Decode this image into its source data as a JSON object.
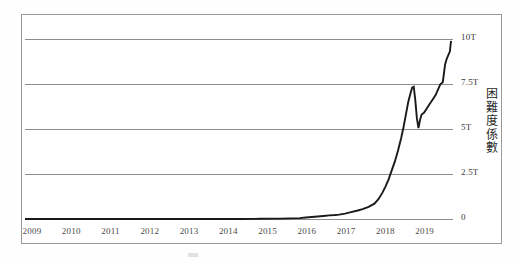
{
  "figure": {
    "background_color": "#ffffff",
    "frame_color": "#9a9a9a",
    "series_color": "#1a1a1a",
    "gridline_color": "#8d8d8d"
  },
  "chart_data": {
    "type": "line",
    "title": "",
    "subtitle": "",
    "xlabel": "",
    "ylabel": "困難度係數",
    "grid": true,
    "legend": "none",
    "xlim": [
      2009.0,
      2019.9
    ],
    "ylim": [
      0,
      10.8
    ],
    "y_unit": "T",
    "x_tick_labels": [
      "2009",
      "2010",
      "2011",
      "2012",
      "2013",
      "2014",
      "2015",
      "2016",
      "2017",
      "2018",
      "2019"
    ],
    "x_ticks": [
      2009,
      2010,
      2011,
      2012,
      2013,
      2014,
      2015,
      2016,
      2017,
      2018,
      2019
    ],
    "y_tick_labels": [
      "0",
      "2.5T",
      "5T",
      "7.5T",
      "10T"
    ],
    "y_ticks": [
      0,
      2.5,
      5,
      7.5,
      10
    ],
    "series": [
      {
        "name": "Bitcoin mining difficulty",
        "x": [
          2009.0,
          2009.5,
          2010.0,
          2010.5,
          2011.0,
          2011.5,
          2012.0,
          2012.5,
          2013.0,
          2013.5,
          2014.0,
          2014.5,
          2015.0,
          2015.5,
          2016.0,
          2016.15,
          2016.3,
          2016.45,
          2016.6,
          2016.75,
          2016.9,
          2017.0,
          2017.15,
          2017.3,
          2017.45,
          2017.6,
          2017.75,
          2017.9,
          2018.0,
          2018.1,
          2018.18,
          2018.26,
          2018.34,
          2018.42,
          2018.5,
          2018.58,
          2018.64,
          2018.7,
          2018.76,
          2018.82,
          2018.86,
          2018.9,
          2018.94,
          2018.98,
          2019.02,
          2019.06,
          2019.1,
          2019.16,
          2019.22,
          2019.28,
          2019.34,
          2019.4,
          2019.46,
          2019.52,
          2019.58,
          2019.64,
          2019.7,
          2019.74,
          2019.78,
          2019.82,
          2019.85
        ],
        "y": [
          0.0,
          0.0,
          0.0,
          0.0,
          0.0,
          0.0,
          0.0,
          0.0,
          0.0,
          0.0,
          0.0,
          0.0,
          0.01,
          0.02,
          0.05,
          0.08,
          0.11,
          0.14,
          0.17,
          0.2,
          0.22,
          0.24,
          0.3,
          0.38,
          0.46,
          0.55,
          0.68,
          0.85,
          1.1,
          1.45,
          1.8,
          2.2,
          2.7,
          3.2,
          3.8,
          4.5,
          5.1,
          5.8,
          6.5,
          7.0,
          7.3,
          7.35,
          6.6,
          5.6,
          5.05,
          5.5,
          5.8,
          5.9,
          6.1,
          6.3,
          6.5,
          6.7,
          6.9,
          7.2,
          7.5,
          7.6,
          8.6,
          8.9,
          9.1,
          9.3,
          9.9
        ]
      }
    ],
    "annotations": [
      {
        "text": "10T",
        "value": 10
      },
      {
        "text": "7.5T",
        "value": 7.5
      },
      {
        "text": "5T",
        "value": 5
      },
      {
        "text": "2.5T",
        "value": 2.5
      },
      {
        "text": "0",
        "value": 0
      }
    ]
  },
  "axis_title_chars": [
    "困",
    "難",
    "度",
    "係",
    "數"
  ]
}
